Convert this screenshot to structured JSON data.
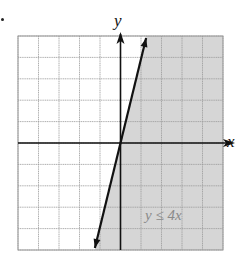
{
  "chart_data": {
    "type": "line",
    "title": "",
    "xlabel": "x",
    "ylabel": "y",
    "xlim": [
      -5,
      5
    ],
    "ylim": [
      -5,
      5
    ],
    "grid": true,
    "grid_step": 1,
    "boundary_line": {
      "equation": "y = 4x",
      "style": "solid",
      "points": [
        [
          -1.25,
          -5
        ],
        [
          1.25,
          5
        ]
      ]
    },
    "shaded_region": {
      "inequality": "y ≤ 4x",
      "side": "below/right of line",
      "color": "#d6d6d6"
    },
    "annotation": {
      "text": "y ≤ 4x",
      "x": 2.5,
      "y": -4
    }
  },
  "labels": {
    "x_axis": "x",
    "y_axis": "y",
    "inequality": "y ≤ 4x"
  },
  "colors": {
    "shade": "#d6d6d6",
    "grid": "#9a9a9a",
    "axis": "#111111",
    "line": "#111111"
  }
}
